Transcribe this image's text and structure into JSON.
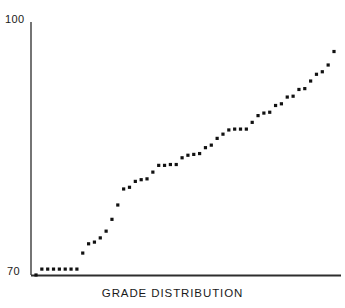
{
  "chart_data": {
    "type": "scatter",
    "title": "",
    "caption": "GRADE DISTRIBUTION",
    "xlabel": "GRADE DISTRIBUTION",
    "ylabel": "",
    "grid": false,
    "legend": false,
    "legend_position": "none",
    "ylim": [
      70,
      100
    ],
    "xlim": [
      0,
      53
    ],
    "y_tick_labels": [
      "100",
      "70"
    ],
    "y_ticks": [
      100,
      70
    ],
    "x_tick_labels": [],
    "marker": "square-dot",
    "marker_color": "#111111",
    "axis_color": "#3a3a3a",
    "x": [
      1,
      2,
      3,
      4,
      5,
      6,
      7,
      8,
      9,
      10,
      11,
      12,
      13,
      14,
      15,
      16,
      17,
      18,
      19,
      20,
      21,
      22,
      23,
      24,
      25,
      26,
      27,
      28,
      29,
      30,
      31,
      32,
      33,
      34,
      35,
      36,
      37,
      38,
      39,
      40,
      41,
      42,
      43,
      44,
      45,
      46,
      47,
      48,
      49,
      50,
      51,
      52
    ],
    "values": [
      70.0,
      70.7,
      70.7,
      70.7,
      70.7,
      70.7,
      70.7,
      70.7,
      72.6,
      73.7,
      73.9,
      74.4,
      75.2,
      76.6,
      78.3,
      80.2,
      80.4,
      81.1,
      81.3,
      81.4,
      82.2,
      83.0,
      83.0,
      83.1,
      83.1,
      83.9,
      84.2,
      84.3,
      84.4,
      85.1,
      85.4,
      86.2,
      86.7,
      87.2,
      87.3,
      87.3,
      87.3,
      88.1,
      88.9,
      89.2,
      89.3,
      90.1,
      90.3,
      91.1,
      91.2,
      92.0,
      92.1,
      93.0,
      93.8,
      94.1,
      94.9,
      96.5
    ]
  },
  "axis": {
    "y_max_label": "100",
    "y_min_label": "70"
  },
  "footer": {
    "caption": "GRADE DISTRIBUTION"
  }
}
